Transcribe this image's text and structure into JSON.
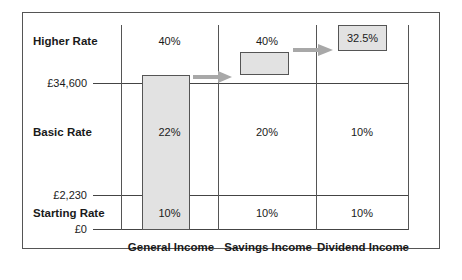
{
  "bands": [
    {
      "name": "Higher Rate",
      "threshold_label": "£34,600"
    },
    {
      "name": "Basic Rate",
      "threshold_label": "£2,230"
    },
    {
      "name": "Starting Rate",
      "threshold_label": "£0"
    }
  ],
  "thresholds": {
    "upper": "£34,600",
    "middle": "£2,230",
    "zero": "£0"
  },
  "columns": [
    {
      "name": "General Income",
      "higher": "40%",
      "basic": "22%",
      "starting": "10%"
    },
    {
      "name": "Savings Income",
      "higher": "40%",
      "basic": "20%",
      "starting": "10%"
    },
    {
      "name": "Dividend Income",
      "higher": "32.5%",
      "basic": "10%",
      "starting": "10%"
    }
  ],
  "colors": {
    "bar_fill": "#e2e2e2",
    "arrow": "#a8a8a8",
    "line": "#444444"
  }
}
